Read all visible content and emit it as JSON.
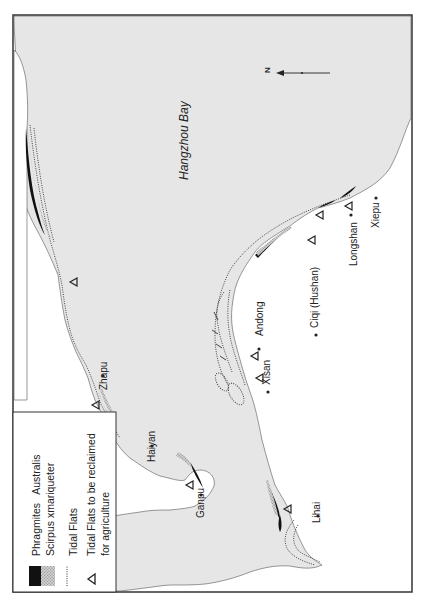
{
  "map": {
    "title": "Hangzhou Bay",
    "north_label": "N",
    "colors": {
      "water": "#e6e6e6",
      "land": "#ffffff",
      "frame": "#333333",
      "phragmites": "#111111",
      "scirpus": "#bdbdbd",
      "tidal_line": "#333333"
    },
    "places": [
      {
        "id": "zhapu",
        "name": "Zhapu"
      },
      {
        "id": "haiyan",
        "name": "Haiyan"
      },
      {
        "id": "ganpu",
        "name": "Ganpu"
      },
      {
        "id": "lihai",
        "name": "Lihai"
      },
      {
        "id": "xisan",
        "name": "Xisan"
      },
      {
        "id": "andong",
        "name": "Andong"
      },
      {
        "id": "ciqi",
        "name": "Ciqi (Hushan)"
      },
      {
        "id": "longshan",
        "name": "Longshan"
      },
      {
        "id": "xiepu",
        "name": "Xiepu"
      }
    ]
  },
  "legend": {
    "items": [
      {
        "symbol": "black-fill",
        "label": "Phragmites   Australis"
      },
      {
        "symbol": "stipple-fill",
        "label": "Scirpus xmariqueter"
      },
      {
        "symbol": "dotted-line",
        "label": "Tidal Flats"
      },
      {
        "symbol": "triangle",
        "label": "Tidal Flats to be reclaimed",
        "label_line2": "for agriculture"
      }
    ]
  }
}
